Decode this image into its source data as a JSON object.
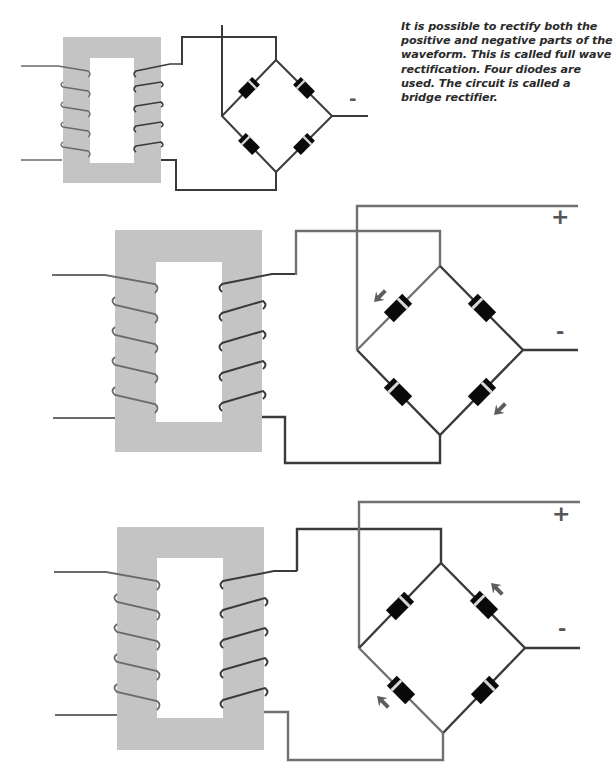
{
  "caption": {
    "text": "It is possible to rectify both the positive and negative parts of the waveform. This is called full wave rectification. Four diodes are used. The circuit is called a bridge rectifier."
  },
  "colors": {
    "core": "#c4c4c4",
    "wire_dark": "#3a3a3a",
    "wire_grey": "#707070",
    "diode_body": "#0a0a0a",
    "diode_band": "#d8d8d8",
    "arrow": "#5e5e5e",
    "label": "#555555"
  },
  "diagrams": [
    {
      "name": "bridge-rectifier-overview",
      "labels": {
        "plus": "",
        "minus": "-"
      },
      "active_path": "none"
    },
    {
      "name": "bridge-rectifier-first-half-cycle",
      "labels": {
        "plus": "+",
        "minus": "-"
      },
      "active_path": "top-left and bottom-right diodes conduct"
    },
    {
      "name": "bridge-rectifier-second-half-cycle",
      "labels": {
        "plus": "+",
        "minus": "-"
      },
      "active_path": "bottom-left and top-right diodes conduct"
    }
  ]
}
